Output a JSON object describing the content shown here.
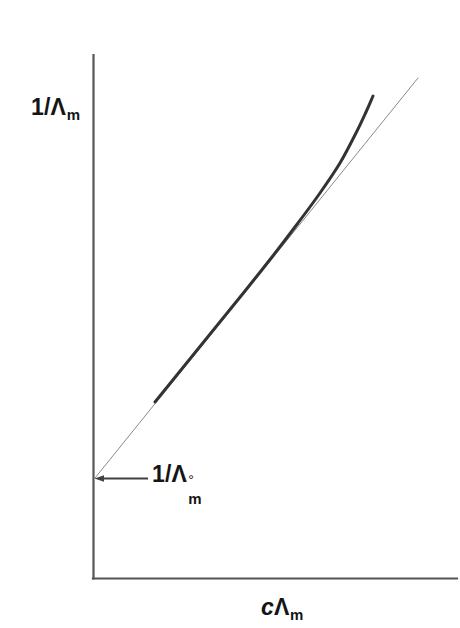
{
  "figure": {
    "background_color": "#ffffff",
    "axis_color": "#555555",
    "curve_color": "#333333",
    "line_color": "#8a8a8a",
    "text_color": "#151515"
  },
  "labels": {
    "y_axis": {
      "prefix": "1/",
      "symbol": "Λ",
      "subscript": "m",
      "full": "1/Λm"
    },
    "x_axis": {
      "variable": "c",
      "symbol": "Λ",
      "subscript": "m",
      "full": "cΛm"
    },
    "intercept": {
      "prefix": "1/",
      "symbol": "Λ",
      "superscript": "°",
      "subscript": "m",
      "full": "1/Λ°m"
    }
  },
  "chart_data": {
    "type": "line",
    "title": "",
    "subtitle": "",
    "xlabel": "cΛm",
    "ylabel": "1/Λm",
    "grid": false,
    "legend": null,
    "axis_style": "open-corner-two-axis",
    "xlim": [
      0,
      1
    ],
    "ylim": [
      0,
      1
    ],
    "axes_pixels": {
      "origin_x": 93,
      "origin_y": 578,
      "y_axis_top": 55,
      "x_axis_right": 457
    },
    "annotations": [
      {
        "name": "intercept-marker",
        "text": "1/Λ°m",
        "point_px": [
          95,
          478
        ],
        "leader_from_px": [
          96,
          478
        ],
        "leader_to_px": [
          148,
          478
        ],
        "arrowhead": true,
        "meaning": "y-intercept equals reciprocal of limiting molar conductivity"
      }
    ],
    "series": [
      {
        "name": "ideal-linear-extrapolation",
        "style": "thin-straight-line",
        "color": "#8a8a8a",
        "width_px": 1,
        "points_px": [
          [
            95,
            478
          ],
          [
            418,
            78
          ]
        ],
        "description": "Straight tangent line extrapolated to the vertical axis giving 1/Λ°m"
      },
      {
        "name": "experimental-curve",
        "style": "thick-curve",
        "color": "#333333",
        "width_px": 3,
        "points_px": [
          [
            155,
            402
          ],
          [
            185,
            365
          ],
          [
            215,
            328
          ],
          [
            245,
            291
          ],
          [
            272,
            257
          ],
          [
            298,
            223
          ],
          [
            320,
            193
          ],
          [
            340,
            163
          ],
          [
            356,
            133
          ],
          [
            366,
            112
          ],
          [
            373,
            96
          ]
        ],
        "description": "Ostwald dilution plot: coincides with the straight line at low cΛm then bends upward above it at high cΛm"
      }
    ]
  }
}
